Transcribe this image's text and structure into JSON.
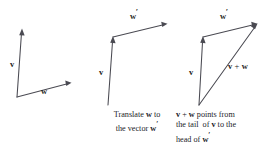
{
  "figure": {
    "background_color": "#ffffff",
    "line_color": "#4a4a52",
    "text_color": "#232329",
    "width": 277,
    "height": 150
  },
  "panels": [
    {
      "id": "panel-1",
      "name": "vectors-from-common-tail",
      "labels": {
        "v": "v",
        "w": "w"
      },
      "caption_lines": []
    },
    {
      "id": "panel-2",
      "name": "translate-w-to-head-of-v",
      "labels": {
        "v": "v",
        "w_prime_base": "w",
        "w_prime_mark": "′"
      },
      "caption_lines": [
        {
          "segments": [
            {
              "text": "Translate ",
              "bold": false
            },
            {
              "text": "w",
              "bold": true
            },
            {
              "text": " to",
              "bold": false
            }
          ]
        },
        {
          "segments": [
            {
              "text": "the vector ",
              "bold": false
            },
            {
              "text": "w",
              "bold": true
            },
            {
              "text": "′",
              "bold": true,
              "prime": true
            }
          ]
        }
      ]
    },
    {
      "id": "panel-3",
      "name": "resultant-sum-vector",
      "labels": {
        "v": "v",
        "w_prime_base": "w",
        "w_prime_mark": "′",
        "sum_v": "v",
        "sum_op": "+",
        "sum_w": "w"
      },
      "caption_lines": [
        {
          "segments": [
            {
              "text": "v",
              "bold": true
            },
            {
              "text": " + ",
              "bold": false
            },
            {
              "text": "w",
              "bold": true
            },
            {
              "text": " points from",
              "bold": false
            }
          ]
        },
        {
          "segments": [
            {
              "text": "the tail  of ",
              "bold": false
            },
            {
              "text": "v",
              "bold": true
            },
            {
              "text": " to the",
              "bold": false
            }
          ]
        },
        {
          "segments": [
            {
              "text": "head of ",
              "bold": false
            },
            {
              "text": "w",
              "bold": true
            },
            {
              "text": "′",
              "bold": true,
              "prime": true
            }
          ]
        }
      ]
    }
  ],
  "geometry": {
    "panel_1": {
      "origin": [
        17,
        97
      ],
      "v_tip": [
        22,
        30
      ],
      "w_tip": [
        71,
        83
      ]
    },
    "panel_2": {
      "origin": [
        20,
        105
      ],
      "v_tip": [
        25,
        37
      ],
      "w_prime_tip": [
        79,
        24
      ]
    },
    "panel_3": {
      "origin": [
        23,
        105
      ],
      "v_tip": [
        27,
        37
      ],
      "w_prime_tip": [
        81,
        24
      ],
      "sum_from": [
        23,
        105
      ],
      "sum_to": [
        81,
        24
      ]
    }
  }
}
